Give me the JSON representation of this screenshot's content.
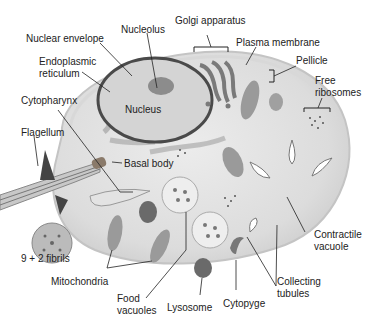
{
  "diagram": {
    "labels": {
      "nuclear_envelope": "Nuclear envelope",
      "nucleolus": "Nucleolus",
      "golgi_apparatus": "Golgi apparatus",
      "plasma_membrane": "Plasma membrane",
      "pellicle": "Pellicle",
      "free_ribosomes_1": "Free",
      "free_ribosomes_2": "ribosomes",
      "endoplasmic_reticulum_1": "Endoplasmic",
      "endoplasmic_reticulum_2": "reticulum",
      "cytopharynx": "Cytopharynx",
      "nucleus": "Nucleus",
      "flagellum": "Flagellum",
      "basal_body": "Basal body",
      "fibrils": "9 + 2 fibrils",
      "mitochondria": "Mitochondria",
      "food_vacuoles_1": "Food",
      "food_vacuoles_2": "vacuoles",
      "lysosome": "Lysosome",
      "cytopyge": "Cytopyge",
      "collecting_tubules_1": "Collecting",
      "collecting_tubules_2": "tubules",
      "contractile_vacuole_1": "Contractile",
      "contractile_vacuole_2": "vacuole"
    },
    "colors": {
      "cell_fill": "#e6e6e6",
      "cell_edge": "#bdbdbd",
      "nucleus_fill": "#d2d2d2",
      "nucleus_edge": "#4a4a4a",
      "organelle": "#8a8a8a",
      "leader_line": "#222222"
    }
  }
}
